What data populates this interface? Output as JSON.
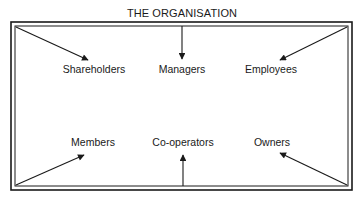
{
  "title": "THE ORGANISATION",
  "colors": {
    "line": "#1a1a1a",
    "background": "#ffffff"
  },
  "stakeholders": {
    "top": [
      {
        "label": "Shareholders",
        "arrow_from": "top-left-corner"
      },
      {
        "label": "Managers",
        "arrow_from": "top-center"
      },
      {
        "label": "Employees",
        "arrow_from": "top-right-corner"
      }
    ],
    "bottom": [
      {
        "label": "Members",
        "arrow_from": "bottom-left-corner"
      },
      {
        "label": "Co-operators",
        "arrow_from": "bottom-center"
      },
      {
        "label": "Owners",
        "arrow_from": "bottom-right-corner"
      }
    ]
  }
}
